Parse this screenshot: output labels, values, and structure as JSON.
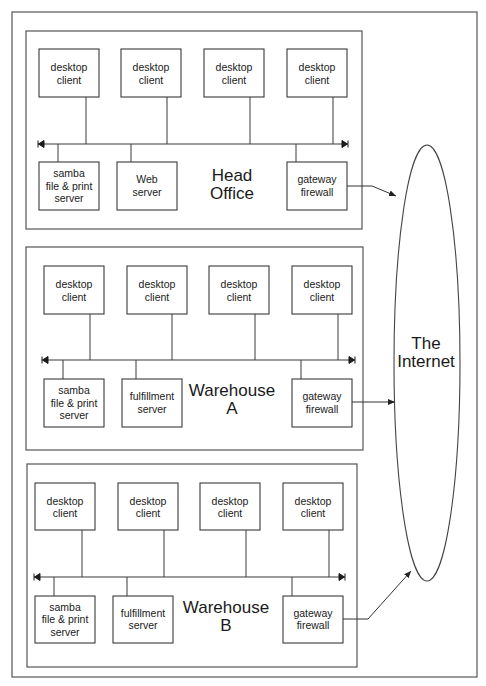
{
  "diagram": {
    "colors": {
      "line": "#3a3a3a",
      "frame": "#555555",
      "background": "#ffffff",
      "text": "#1a1a1a"
    },
    "frame": {
      "x": 12,
      "y": 12,
      "w": 465,
      "h": 665
    },
    "internet": {
      "label_line1": "The",
      "label_line2": "Internet",
      "cx": 427,
      "cy": 363,
      "rx": 33,
      "ry": 218
    },
    "sites": [
      {
        "id": "head-office",
        "label_line1": "Head",
        "label_line2": "Office",
        "box": {
          "x": 26,
          "y": 31,
          "w": 336,
          "h": 198
        },
        "label_pos": {
          "x": 232,
          "y": 181
        },
        "bus": {
          "y": 144,
          "x1": 38,
          "x2": 348
        },
        "clients": [
          {
            "line1": "desktop",
            "line2": "client",
            "x": 39,
            "y": 49,
            "w": 60,
            "h": 48,
            "drop_x": 86
          },
          {
            "line1": "desktop",
            "line2": "client",
            "x": 121,
            "y": 49,
            "w": 60,
            "h": 48,
            "drop_x": 167
          },
          {
            "line1": "desktop",
            "line2": "client",
            "x": 204,
            "y": 49,
            "w": 60,
            "h": 48,
            "drop_x": 250
          },
          {
            "line1": "desktop",
            "line2": "client",
            "x": 287,
            "y": 49,
            "w": 60,
            "h": 48,
            "drop_x": 333
          }
        ],
        "servers": [
          {
            "lines": [
              "samba",
              "file & print",
              "server"
            ],
            "x": 39,
            "y": 162,
            "w": 60,
            "h": 48,
            "drop_x": 58
          },
          {
            "lines": [
              "Web",
              "server"
            ],
            "x": 117,
            "y": 162,
            "w": 60,
            "h": 48,
            "drop_x": 131
          },
          {
            "lines": [
              "gateway",
              "firewall"
            ],
            "x": 287,
            "y": 162,
            "w": 60,
            "h": 48,
            "drop_x": 296,
            "gateway": true
          }
        ],
        "uplink": {
          "points": [
            [
              347,
              186
            ],
            [
              372,
              186
            ],
            [
              396,
              196
            ]
          ]
        }
      },
      {
        "id": "warehouse-a",
        "label_line1": "Warehouse",
        "label_line2": "A",
        "box": {
          "x": 26,
          "y": 247,
          "w": 337,
          "h": 203
        },
        "label_pos": {
          "x": 232,
          "y": 396
        },
        "bus": {
          "y": 360,
          "x1": 42,
          "x2": 355
        },
        "clients": [
          {
            "line1": "desktop",
            "line2": "client",
            "x": 44,
            "y": 266,
            "w": 60,
            "h": 48,
            "drop_x": 90
          },
          {
            "line1": "desktop",
            "line2": "client",
            "x": 127,
            "y": 266,
            "w": 60,
            "h": 48,
            "drop_x": 172
          },
          {
            "line1": "desktop",
            "line2": "client",
            "x": 209,
            "y": 266,
            "w": 60,
            "h": 48,
            "drop_x": 255
          },
          {
            "line1": "desktop",
            "line2": "client",
            "x": 292,
            "y": 266,
            "w": 60,
            "h": 48,
            "drop_x": 338
          }
        ],
        "servers": [
          {
            "lines": [
              "samba",
              "file & print",
              "server"
            ],
            "x": 44,
            "y": 379,
            "w": 60,
            "h": 48,
            "drop_x": 63
          },
          {
            "lines": [
              "fulfillment",
              "server"
            ],
            "x": 122,
            "y": 379,
            "w": 60,
            "h": 48,
            "drop_x": 136
          },
          {
            "lines": [
              "gateway",
              "firewall"
            ],
            "x": 292,
            "y": 379,
            "w": 60,
            "h": 48,
            "drop_x": 301,
            "gateway": true
          }
        ],
        "uplink": {
          "points": [
            [
              352,
              402
            ],
            [
              395,
              402
            ]
          ]
        }
      },
      {
        "id": "warehouse-b",
        "label_line1": "Warehouse",
        "label_line2": "B",
        "box": {
          "x": 27,
          "y": 464,
          "w": 330,
          "h": 203
        },
        "label_pos": {
          "x": 226,
          "y": 613
        },
        "bus": {
          "y": 577,
          "x1": 34,
          "x2": 345
        },
        "clients": [
          {
            "line1": "desktop",
            "line2": "client",
            "x": 35,
            "y": 483,
            "w": 60,
            "h": 47,
            "drop_x": 82
          },
          {
            "line1": "desktop",
            "line2": "client",
            "x": 118,
            "y": 483,
            "w": 60,
            "h": 47,
            "drop_x": 164
          },
          {
            "line1": "desktop",
            "line2": "client",
            "x": 200,
            "y": 483,
            "w": 60,
            "h": 47,
            "drop_x": 246
          },
          {
            "line1": "desktop",
            "line2": "client",
            "x": 283,
            "y": 483,
            "w": 60,
            "h": 47,
            "drop_x": 329
          }
        ],
        "servers": [
          {
            "lines": [
              "samba",
              "file & print",
              "server"
            ],
            "x": 35,
            "y": 596,
            "w": 60,
            "h": 47,
            "drop_x": 54
          },
          {
            "lines": [
              "fulfillment",
              "server"
            ],
            "x": 113,
            "y": 596,
            "w": 60,
            "h": 47,
            "drop_x": 127
          },
          {
            "lines": [
              "gateway",
              "firewall"
            ],
            "x": 283,
            "y": 596,
            "w": 60,
            "h": 47,
            "drop_x": 292,
            "gateway": true
          }
        ],
        "uplink": {
          "points": [
            [
              343,
              619
            ],
            [
              368,
              619
            ],
            [
              411,
              571
            ]
          ]
        }
      }
    ]
  }
}
